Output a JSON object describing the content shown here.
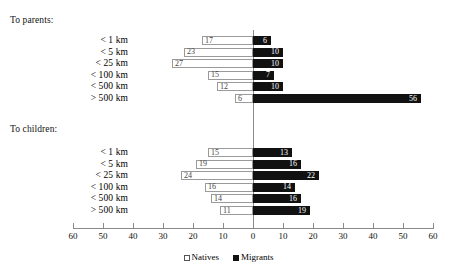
{
  "chart_data": {
    "type": "bar",
    "orientation": "horizontal-diverging",
    "title": "",
    "xlabel": "",
    "ylabel": "",
    "grid": false,
    "axis_ticks": [
      60,
      50,
      40,
      30,
      20,
      10,
      0,
      10,
      20,
      30,
      40,
      50,
      60
    ],
    "xlim": [
      -60,
      60
    ],
    "legend_position": "bottom-center",
    "legend": [
      {
        "name": "Natives",
        "color": "#ffffff",
        "marker": "open-square"
      },
      {
        "name": "Migrants",
        "color": "#111111",
        "marker": "filled-square"
      }
    ],
    "groups": [
      {
        "caption": "To parents:",
        "categories": [
          "< 1 km",
          "< 5 km",
          "< 25 km",
          "< 100 km",
          "< 500 km",
          "> 500 km"
        ],
        "series": [
          {
            "name": "Natives",
            "side": "left",
            "values": [
              17,
              23,
              27,
              15,
              12,
              6
            ]
          },
          {
            "name": "Migrants",
            "side": "right",
            "values": [
              6,
              10,
              10,
              7,
              10,
              56
            ]
          }
        ]
      },
      {
        "caption": "To children:",
        "categories": [
          "< 1 km",
          "< 5 km",
          "< 25 km",
          "< 100 km",
          "< 500 km",
          "> 500 km"
        ],
        "series": [
          {
            "name": "Natives",
            "side": "left",
            "values": [
              15,
              19,
              24,
              16,
              14,
              11
            ]
          },
          {
            "name": "Migrants",
            "side": "right",
            "values": [
              13,
              16,
              22,
              14,
              16,
              19
            ]
          }
        ]
      }
    ]
  },
  "layout": {
    "zero_x": 253,
    "px_per_unit": 3,
    "label_right_edge": 128,
    "group_tops": [
      36,
      148
    ],
    "row_pitch": 11.6,
    "bar_height": 9
  }
}
